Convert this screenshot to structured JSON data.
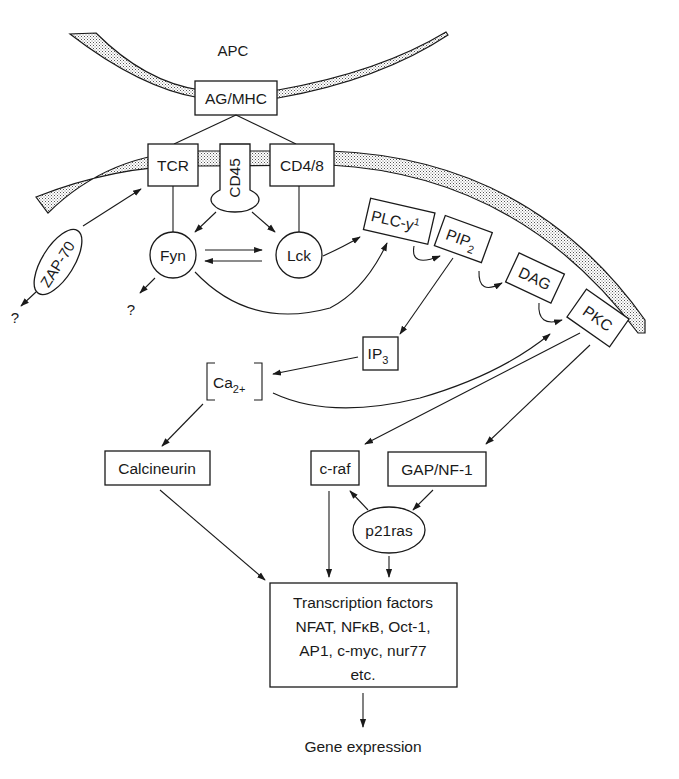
{
  "diagram": {
    "cells": {
      "apc_label": "APC"
    },
    "nodes": {
      "ag_mhc": "AG/MHC",
      "tcr": "TCR",
      "cd45": "CD45",
      "cd4_8": "CD4/8",
      "zap70": "ZAP-70",
      "fyn": "Fyn",
      "lck": "Lck",
      "plc": "PLC-y",
      "plc_sup": "1",
      "pip2": "PIP",
      "pip2_sub": "2",
      "dag": "DAG",
      "pkc": "PKC",
      "ip3": "IP",
      "ip3_sub": "3",
      "ca": "Ca",
      "ca_sub": "2+",
      "calcineurin": "Calcineurin",
      "craf": "c-raf",
      "gap_nf1": "GAP/NF-1",
      "p21ras": "p21ras",
      "tf_line1": "Transcription factors",
      "tf_line2": "NFAT, NFκB, Oct-1,",
      "tf_line3": "AP1, c-myc, nur77",
      "tf_line4": "etc.",
      "gene_expression": "Gene expression",
      "unknown_zap": "?",
      "unknown_fyn": "?"
    },
    "edges": [
      {
        "from": "AG/MHC",
        "to": "TCR",
        "type": "line"
      },
      {
        "from": "AG/MHC",
        "to": "CD4/8",
        "type": "line"
      },
      {
        "from": "TCR",
        "to": "Fyn",
        "type": "line"
      },
      {
        "from": "CD4/8",
        "to": "Lck",
        "type": "line"
      },
      {
        "from": "CD45",
        "to": "Fyn",
        "type": "arrow"
      },
      {
        "from": "CD45",
        "to": "Lck",
        "type": "arrow"
      },
      {
        "from": "Fyn",
        "to": "Lck",
        "type": "arrow"
      },
      {
        "from": "Lck",
        "to": "Fyn",
        "type": "arrow"
      },
      {
        "from": "ZAP-70",
        "to": "TCR",
        "type": "arrow"
      },
      {
        "from": "ZAP-70",
        "to": "?",
        "type": "arrow"
      },
      {
        "from": "Fyn",
        "to": "?",
        "type": "arrow"
      },
      {
        "from": "Lck",
        "to": "PLC-y1",
        "type": "arrow"
      },
      {
        "from": "Fyn",
        "to": "PLC-y1",
        "type": "arrow"
      },
      {
        "from": "PLC-y1",
        "to": "PIP2",
        "type": "curved-arrow"
      },
      {
        "from": "PIP2",
        "to": "DAG",
        "type": "curved-arrow"
      },
      {
        "from": "DAG",
        "to": "PKC",
        "type": "curved-arrow"
      },
      {
        "from": "PIP2",
        "to": "IP3",
        "type": "arrow"
      },
      {
        "from": "IP3",
        "to": "Ca2+",
        "type": "arrow"
      },
      {
        "from": "Ca2+",
        "to": "PKC",
        "type": "arrow"
      },
      {
        "from": "PKC",
        "to": "c-raf",
        "type": "arrow"
      },
      {
        "from": "PKC",
        "to": "GAP/NF-1",
        "type": "arrow"
      },
      {
        "from": "Ca2+",
        "to": "Calcineurin",
        "type": "arrow"
      },
      {
        "from": "GAP/NF-1",
        "to": "p21ras",
        "type": "arrow"
      },
      {
        "from": "p21ras",
        "to": "c-raf",
        "type": "arrow"
      },
      {
        "from": "Calcineurin",
        "to": "Transcription factors",
        "type": "arrow"
      },
      {
        "from": "c-raf",
        "to": "Transcription factors",
        "type": "arrow"
      },
      {
        "from": "p21ras",
        "to": "Transcription factors",
        "type": "arrow"
      },
      {
        "from": "Transcription factors",
        "to": "Gene expression",
        "type": "arrow"
      }
    ]
  }
}
